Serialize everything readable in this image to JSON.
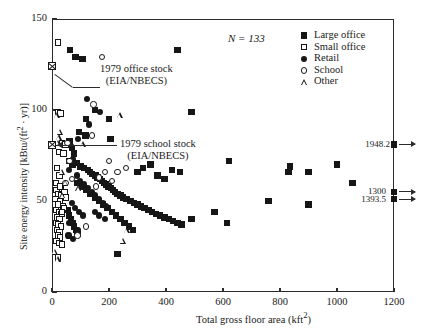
{
  "chart_data": {
    "type": "scatter",
    "title": "",
    "xlabel": "Total gross floor area (kft²)",
    "ylabel": "Site energy intensity [kBtu/(ft² · yr)]",
    "xlim": [
      0,
      1200
    ],
    "ylim": [
      0,
      150
    ],
    "xticks": [
      0,
      200,
      400,
      600,
      800,
      1000,
      1200
    ],
    "yticks": [
      0,
      50,
      100,
      150
    ],
    "grid": false,
    "sample_size_label": "N = 133",
    "legend_position": "top-right",
    "series": [
      {
        "name": "Large office",
        "marker": "filled-square",
        "points": [
          [
            63,
            133
          ],
          [
            83,
            129
          ],
          [
            107,
            128
          ],
          [
            120,
            95
          ],
          [
            200,
            95
          ],
          [
            440,
            133
          ],
          [
            490,
            99
          ],
          [
            118,
            86
          ],
          [
            150,
            100
          ],
          [
            95,
            88
          ],
          [
            205,
            84
          ],
          [
            62,
            83
          ],
          [
            70,
            79
          ],
          [
            77,
            76
          ],
          [
            60,
            72
          ],
          [
            72,
            70
          ],
          [
            88,
            71
          ],
          [
            100,
            69
          ],
          [
            112,
            68
          ],
          [
            126,
            67
          ],
          [
            134,
            66
          ],
          [
            141,
            65
          ],
          [
            152,
            64
          ],
          [
            160,
            63
          ],
          [
            168,
            62
          ],
          [
            175,
            61
          ],
          [
            182,
            60
          ],
          [
            190,
            59
          ],
          [
            198,
            58
          ],
          [
            206,
            57
          ],
          [
            214,
            56
          ],
          [
            222,
            55
          ],
          [
            230,
            54
          ],
          [
            240,
            53
          ],
          [
            250,
            52
          ],
          [
            262,
            51
          ],
          [
            275,
            50
          ],
          [
            288,
            49
          ],
          [
            300,
            48
          ],
          [
            312,
            47
          ],
          [
            325,
            46
          ],
          [
            338,
            45
          ],
          [
            350,
            44
          ],
          [
            365,
            43
          ],
          [
            380,
            42
          ],
          [
            395,
            41
          ],
          [
            410,
            40
          ],
          [
            425,
            39
          ],
          [
            440,
            38
          ],
          [
            455,
            37
          ],
          [
            300,
            66
          ],
          [
            320,
            68
          ],
          [
            345,
            70
          ],
          [
            370,
            64
          ],
          [
            395,
            62
          ],
          [
            420,
            67
          ],
          [
            450,
            66
          ],
          [
            90,
            60
          ],
          [
            105,
            58
          ],
          [
            120,
            56
          ],
          [
            135,
            54
          ],
          [
            150,
            52
          ],
          [
            165,
            50
          ],
          [
            180,
            48
          ],
          [
            195,
            46
          ],
          [
            210,
            44
          ],
          [
            225,
            42
          ],
          [
            240,
            40
          ],
          [
            255,
            38
          ],
          [
            270,
            36
          ],
          [
            285,
            34
          ],
          [
            55,
            45
          ],
          [
            60,
            42
          ],
          [
            66,
            40
          ],
          [
            72,
            38
          ],
          [
            78,
            36
          ],
          [
            84,
            34
          ],
          [
            90,
            32
          ],
          [
            230,
            21
          ],
          [
            490,
            40
          ],
          [
            570,
            44
          ],
          [
            620,
            72
          ],
          [
            615,
            38
          ],
          [
            760,
            50
          ],
          [
            830,
            66
          ],
          [
            835,
            69
          ],
          [
            900,
            48
          ],
          [
            900,
            66
          ],
          [
            1000,
            70
          ],
          [
            1055,
            60
          ]
        ]
      },
      {
        "name": "Small office",
        "marker": "open-square",
        "points": [
          [
            20,
            137
          ],
          [
            22,
            99
          ],
          [
            30,
            98
          ],
          [
            36,
            82
          ],
          [
            48,
            81
          ],
          [
            24,
            77
          ],
          [
            40,
            76
          ],
          [
            18,
            68
          ],
          [
            26,
            64
          ],
          [
            14,
            60
          ],
          [
            30,
            58
          ],
          [
            16,
            56
          ],
          [
            22,
            54
          ],
          [
            34,
            53
          ],
          [
            12,
            51
          ],
          [
            28,
            50
          ],
          [
            20,
            48
          ],
          [
            38,
            47
          ],
          [
            15,
            45
          ],
          [
            25,
            44
          ],
          [
            33,
            43
          ],
          [
            18,
            41
          ],
          [
            27,
            40
          ],
          [
            13,
            38
          ],
          [
            22,
            37
          ],
          [
            31,
            36
          ],
          [
            17,
            34
          ],
          [
            26,
            33
          ],
          [
            20,
            31
          ],
          [
            29,
            30
          ],
          [
            16,
            28
          ],
          [
            24,
            27
          ],
          [
            35,
            26
          ],
          [
            22,
            19
          ],
          [
            28,
            58
          ],
          [
            44,
            55
          ],
          [
            50,
            52
          ],
          [
            42,
            46
          ],
          [
            36,
            44
          ]
        ]
      },
      {
        "name": "Retail",
        "marker": "filled-circle",
        "points": [
          [
            122,
            106
          ],
          [
            170,
            99
          ],
          [
            130,
            92
          ],
          [
            92,
            84
          ],
          [
            66,
            80
          ],
          [
            75,
            73
          ],
          [
            60,
            67
          ],
          [
            88,
            64
          ],
          [
            100,
            61
          ],
          [
            112,
            59
          ],
          [
            125,
            57
          ],
          [
            140,
            55
          ],
          [
            152,
            53
          ],
          [
            165,
            51
          ],
          [
            178,
            49
          ],
          [
            190,
            47
          ],
          [
            70,
            49
          ],
          [
            80,
            46
          ],
          [
            95,
            44
          ],
          [
            110,
            42
          ],
          [
            62,
            38
          ],
          [
            78,
            36
          ],
          [
            90,
            34
          ],
          [
            58,
            31
          ],
          [
            74,
            29
          ],
          [
            150,
            44
          ],
          [
            165,
            42
          ],
          [
            185,
            40
          ]
        ]
      },
      {
        "name": "School",
        "marker": "open-circle",
        "points": [
          [
            175,
            129
          ],
          [
            145,
            103
          ],
          [
            140,
            86
          ],
          [
            55,
            82
          ],
          [
            62,
            72
          ],
          [
            70,
            62
          ],
          [
            185,
            66
          ],
          [
            230,
            66
          ],
          [
            165,
            63
          ],
          [
            210,
            61
          ],
          [
            120,
            36
          ],
          [
            90,
            31
          ],
          [
            48,
            60
          ],
          [
            200,
            72
          ],
          [
            260,
            68
          ],
          [
            155,
            58
          ]
        ]
      },
      {
        "name": "Other",
        "marker": "open-triangle",
        "points": [
          [
            18,
            97
          ],
          [
            30,
            88
          ],
          [
            25,
            85
          ],
          [
            22,
            82
          ],
          [
            240,
            97
          ],
          [
            110,
            81
          ],
          [
            95,
            57
          ],
          [
            38,
            53
          ],
          [
            12,
            22
          ],
          [
            22,
            18
          ],
          [
            250,
            28
          ],
          [
            265,
            34
          ],
          [
            48,
            60
          ],
          [
            36,
            66
          ]
        ]
      }
    ],
    "annotations": [
      {
        "id": "office-stock",
        "text_line1": "1979 office stock",
        "text_line2": "(EIA/NBECS)",
        "marker": "crossed-square",
        "marker_point": [
          0,
          124
        ]
      },
      {
        "id": "school-stock",
        "text_line1": "1979 school stock",
        "text_line2": "(EIA/NBECS)",
        "marker": "crossed-square",
        "marker_point": [
          0,
          81
        ]
      }
    ],
    "offscale_labels": [
      {
        "value": "1948.2",
        "y": 81
      },
      {
        "value": "1300",
        "y": 55
      },
      {
        "value": "1393.5",
        "y": 51
      }
    ]
  },
  "legend": {
    "items": [
      {
        "label": "Large office",
        "marker": "filled-square"
      },
      {
        "label": "Small office",
        "marker": "open-square"
      },
      {
        "label": "Retail",
        "marker": "filled-circle"
      },
      {
        "label": "School",
        "marker": "open-circle"
      },
      {
        "label": "Other",
        "marker": "open-triangle"
      }
    ]
  }
}
